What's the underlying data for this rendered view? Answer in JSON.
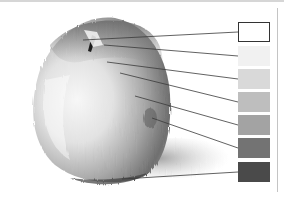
{
  "figure": {
    "value_scale": {
      "swatches": [
        {
          "index": 1,
          "role": "highlight",
          "color": "#ffffff",
          "outlined": true
        },
        {
          "index": 2,
          "role": "light",
          "color": "#f1f1f1",
          "outlined": false
        },
        {
          "index": 3,
          "role": "light-midtone",
          "color": "#d9d9d9",
          "outlined": false
        },
        {
          "index": 4,
          "role": "midtone",
          "color": "#bebebe",
          "outlined": false
        },
        {
          "index": 5,
          "role": "dark-midtone",
          "color": "#a3a3a3",
          "outlined": false
        },
        {
          "index": 6,
          "role": "shadow",
          "color": "#737373",
          "outlined": false
        },
        {
          "index": 7,
          "role": "darkest-accent",
          "color": "#4a4a4a",
          "outlined": false
        }
      ]
    },
    "colors": {
      "leader_line": "#3a3a3a",
      "frame_rule": "#c4c4c4"
    }
  }
}
